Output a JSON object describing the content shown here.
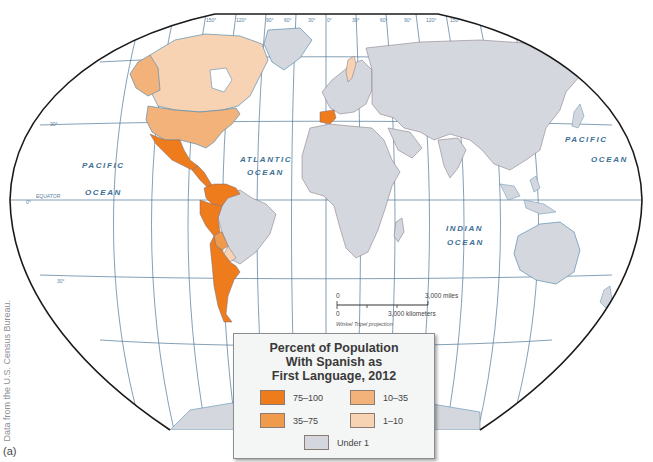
{
  "figure": {
    "label": "(a)",
    "source_note": "Data from the U.S. Census Bureau."
  },
  "legend": {
    "title_lines": [
      "Percent of Population",
      "With Spanish as",
      "First Language, 2012"
    ],
    "items": [
      {
        "label": "75–100",
        "color": "#ee7b1c"
      },
      {
        "label": "10–35",
        "color": "#f3b27a"
      },
      {
        "label": "35–75",
        "color": "#f09a4c"
      },
      {
        "label": "1–10",
        "color": "#f8d3b3"
      },
      {
        "label": "Under 1",
        "color": "#d5d7de"
      }
    ]
  },
  "map": {
    "projection": "Winkel Tripel projection",
    "colors": {
      "ocean": "#ffffff",
      "graticule": "#4f7797",
      "coast": "#5a8fb0",
      "border": "#7b6f78",
      "outline": "#1a1a1a"
    },
    "ocean_labels": {
      "pacific_west": [
        "PACIFIC",
        "OCEAN"
      ],
      "atlantic": [
        "ATLANTIC",
        "OCEAN"
      ],
      "indian": [
        "INDIAN",
        "OCEAN"
      ],
      "pacific_east": [
        "PACIFIC",
        "OCEAN"
      ]
    },
    "graticule_labels": {
      "longitudes": [
        "150°",
        "120°",
        "90°",
        "60°",
        "30°",
        "0°",
        "30°",
        "60°",
        "90°",
        "120°",
        "150°"
      ],
      "latitudes": [
        "30°",
        "0°",
        "30°"
      ],
      "equator": "EQUATOR"
    },
    "scale_bar": {
      "zero_top": "0",
      "miles": "3,000 miles",
      "zero_bottom": "0",
      "km": "3,000 kilometers"
    },
    "regions": [
      {
        "name": "Spain",
        "category": "75–100"
      },
      {
        "name": "Mexico",
        "category": "75–100"
      },
      {
        "name": "Central America",
        "category": "75–100"
      },
      {
        "name": "Colombia",
        "category": "75–100"
      },
      {
        "name": "Venezuela",
        "category": "75–100"
      },
      {
        "name": "Ecuador",
        "category": "75–100"
      },
      {
        "name": "Peru",
        "category": "75–100"
      },
      {
        "name": "Chile",
        "category": "75–100"
      },
      {
        "name": "Argentina",
        "category": "75–100"
      },
      {
        "name": "Uruguay",
        "category": "75–100"
      },
      {
        "name": "Bolivia",
        "category": "35–75"
      },
      {
        "name": "United States",
        "category": "10–35"
      },
      {
        "name": "Paraguay",
        "category": "1–10"
      },
      {
        "name": "Canada",
        "category": "1–10"
      },
      {
        "name": "Alaska",
        "category": "10–35"
      },
      {
        "name": "Sweden",
        "category": "1–10"
      },
      {
        "name": "Rest of world",
        "category": "Under 1"
      }
    ]
  }
}
